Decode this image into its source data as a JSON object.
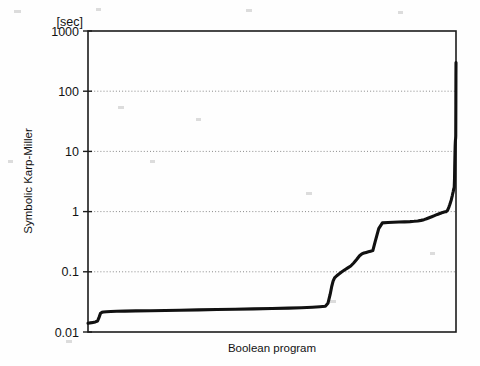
{
  "chart_data": {
    "type": "line",
    "title": "",
    "subtitle": "",
    "xlabel": "Boolean program",
    "ylabel": "Symbolic Karp-Miller",
    "yunit": "[sec]",
    "yscale": "log",
    "xscale": "linear",
    "ylim": [
      0.01,
      1000
    ],
    "xlim": [
      0,
      1
    ],
    "grid": "horizontal-dotted",
    "legend": "none",
    "ytick_labels": [
      "1000",
      "100",
      "10",
      "1",
      "0.1",
      "0.01"
    ],
    "ytick_values": [
      1000,
      100,
      10,
      1,
      0.1,
      0.01
    ],
    "xtick_labels": [],
    "gridline_values": [
      100,
      10,
      1,
      0.1
    ],
    "series": [
      {
        "name": "Symbolic Karp-Miller",
        "color": "#111111",
        "x": [
          0.0,
          0.01,
          0.02,
          0.026,
          0.03,
          0.034,
          0.038,
          0.042,
          0.05,
          0.062,
          0.078,
          0.1,
          0.13,
          0.17,
          0.21,
          0.25,
          0.3,
          0.35,
          0.4,
          0.45,
          0.5,
          0.545,
          0.58,
          0.61,
          0.63,
          0.645,
          0.652,
          0.658,
          0.662,
          0.666,
          0.67,
          0.676,
          0.682,
          0.69,
          0.698,
          0.706,
          0.714,
          0.722,
          0.73,
          0.738,
          0.744,
          0.75,
          0.756,
          0.762,
          0.768,
          0.774,
          0.78,
          0.79,
          0.8,
          0.815,
          0.83,
          0.845,
          0.86,
          0.875,
          0.886,
          0.896,
          0.905,
          0.913,
          0.92,
          0.927,
          0.934,
          0.94,
          0.946,
          0.951,
          0.956,
          0.96,
          0.964,
          0.968,
          0.971,
          0.974,
          0.977,
          0.979,
          0.981,
          0.983,
          0.985,
          0.987,
          0.9885,
          0.99,
          0.9912,
          0.9924,
          0.9934,
          0.9944,
          0.9952,
          0.996,
          0.9966,
          0.9972,
          0.9977,
          0.9982,
          0.9986,
          0.999,
          0.9993,
          0.9996,
          0.9998,
          1.0
        ],
        "y": [
          0.014,
          0.0143,
          0.0147,
          0.0152,
          0.0175,
          0.0205,
          0.0212,
          0.0215,
          0.0217,
          0.0219,
          0.0221,
          0.0222,
          0.0224,
          0.0226,
          0.0228,
          0.023,
          0.0233,
          0.0236,
          0.0239,
          0.0242,
          0.0245,
          0.0249,
          0.0253,
          0.0258,
          0.0263,
          0.0268,
          0.03,
          0.042,
          0.056,
          0.07,
          0.079,
          0.086,
          0.092,
          0.1,
          0.108,
          0.116,
          0.125,
          0.14,
          0.16,
          0.185,
          0.198,
          0.205,
          0.21,
          0.215,
          0.22,
          0.225,
          0.31,
          0.52,
          0.65,
          0.66,
          0.665,
          0.67,
          0.675,
          0.682,
          0.69,
          0.7,
          0.715,
          0.735,
          0.76,
          0.79,
          0.82,
          0.85,
          0.88,
          0.905,
          0.93,
          0.95,
          0.97,
          0.985,
          0.995,
          1.0,
          1.05,
          1.12,
          1.2,
          1.3,
          1.42,
          1.55,
          1.7,
          1.85,
          2.0,
          2.15,
          2.3,
          2.45,
          2.5,
          3.5,
          6.0,
          9.0,
          12.0,
          14.5,
          15.5,
          16.5,
          18.0,
          60.0,
          180.0,
          300.0
        ]
      }
    ],
    "annotations": [
      {
        "text": "curve is a sorted runtime (cactus) plot: flat near 0.022 s for most programs, stepped rise after ~65% of instances, near-vertical spike to ~300 s at the last instances"
      }
    ]
  },
  "axes": {
    "y_unit_label": "[sec]",
    "y_title": "Symbolic Karp-Miller",
    "x_title": "Boolean program"
  },
  "ticks": {
    "y": [
      {
        "label": "1000",
        "value": 1000
      },
      {
        "label": "100",
        "value": 100
      },
      {
        "label": "10",
        "value": 10
      },
      {
        "label": "1",
        "value": 1
      },
      {
        "label": "0.1",
        "value": 0.1
      },
      {
        "label": "0.01",
        "value": 0.01
      }
    ]
  },
  "colors": {
    "curve": "#111111",
    "frame": "#1c1c1c",
    "grid": "#7d7d7d",
    "background": "#fefefe",
    "text": "#131313"
  }
}
